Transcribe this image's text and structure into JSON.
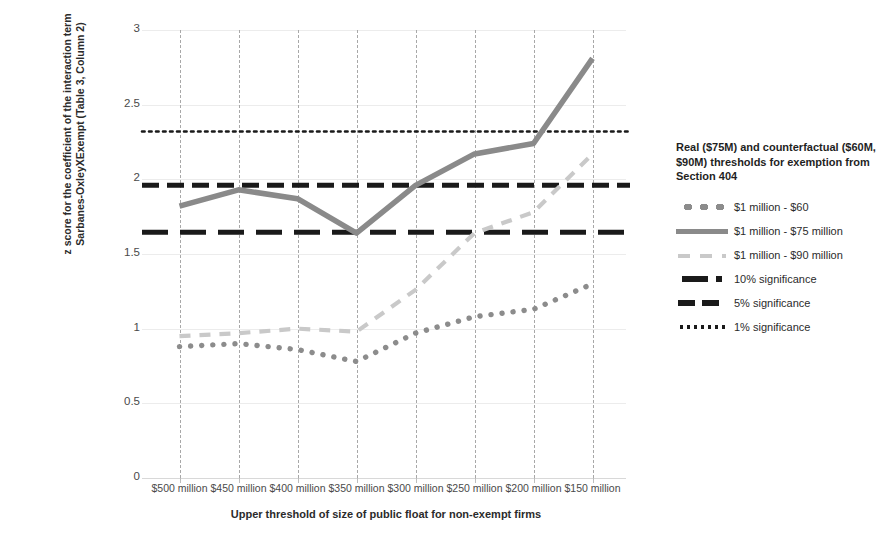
{
  "chart_data": {
    "type": "line",
    "title": "",
    "xlabel": "Upper threshold of size of public float for non-exempt firms",
    "ylabel_line1": "z score for the coefficient of the interaction term",
    "ylabel_line2": "Sarbanes-OxleyXExempt (Table 3, Column 2)",
    "categories": [
      "$500 million",
      "$450 million",
      "$400 million",
      "$350 million",
      "$300 million",
      "$250 million",
      "$200 million",
      "$150 million"
    ],
    "ylim": [
      0,
      3
    ],
    "yticks": [
      "0",
      "0.5",
      "1",
      "1.5",
      "2",
      "2.5",
      "3"
    ],
    "ytick_values": [
      0,
      0.5,
      1,
      1.5,
      2,
      2.5,
      3
    ],
    "grid": "both",
    "legend_position": "right",
    "series": [
      {
        "name": "$1 million - $60",
        "style": "dotted",
        "color": "#8c8c8c",
        "values": [
          0.88,
          0.9,
          0.86,
          0.78,
          0.97,
          1.08,
          1.13,
          1.3
        ]
      },
      {
        "name": "$1 million - $75 million",
        "style": "solid",
        "color": "#8a8a8a",
        "values": [
          1.82,
          1.93,
          1.87,
          1.64,
          1.96,
          2.17,
          2.24,
          2.81
        ]
      },
      {
        "name": "$1 million - $90 million",
        "style": "dashed-light",
        "color": "#c9c9c9",
        "values": [
          0.95,
          0.97,
          1.0,
          0.98,
          1.26,
          1.64,
          1.78,
          2.17
        ]
      }
    ],
    "reference_lines": [
      {
        "name": "10% significance",
        "value": 1.645,
        "style": "dashed-long",
        "color": "#1a1a1a"
      },
      {
        "name": "5% significance",
        "value": 1.96,
        "style": "dashed",
        "color": "#1a1a1a"
      },
      {
        "name": "1% significance",
        "value": 2.32,
        "style": "dotted",
        "color": "#1a1a1a"
      }
    ]
  },
  "legend": {
    "title": "Real ($75M) and counterfactual ($60M, $90M) thresholds for exemption from Section 404",
    "items": [
      {
        "label": "$1 million - $60",
        "key": "dotted-gray-key"
      },
      {
        "label": "$1 million - $75 million",
        "key": "solid-gray-key"
      },
      {
        "label": "$1 million - $90 million",
        "key": "dashed-light-gray-key"
      },
      {
        "label": "10% significance",
        "key": "dashed-long-black-key"
      },
      {
        "label": "5% significance",
        "key": "dashed-black-key"
      },
      {
        "label": "1% significance",
        "key": "dotted-black-key"
      }
    ]
  }
}
